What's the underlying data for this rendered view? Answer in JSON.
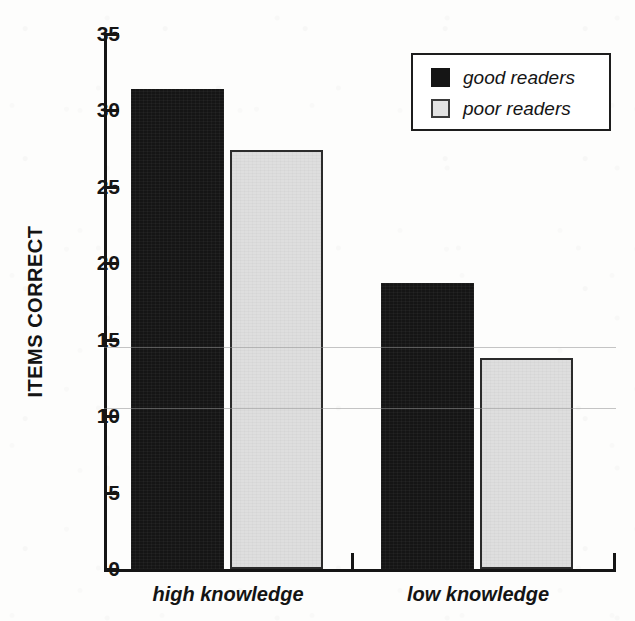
{
  "chart_data": {
    "type": "bar",
    "title": "",
    "subtitle": "",
    "xlabel": "",
    "ylabel": "ITEMS CORRECT",
    "categories": [
      "high knowledge",
      "low knowledge"
    ],
    "series": [
      {
        "name": "good readers",
        "color": "#151515",
        "values": [
          31.4,
          18.7
        ]
      },
      {
        "name": "poor readers",
        "color": "#dedede",
        "values": [
          27.4,
          13.8
        ]
      }
    ],
    "ylim": [
      0,
      35
    ],
    "yticks": [
      0,
      5,
      10,
      15,
      20,
      25,
      30,
      35
    ],
    "ytick_labels": [
      "0",
      "5",
      "10",
      "15",
      "20",
      "25",
      "30",
      "35"
    ],
    "grid": false,
    "legend_position": "top-right",
    "legend_entries": [
      "good readers",
      "poor readers"
    ]
  },
  "axis": {
    "y_title": "ITEMS CORRECT",
    "ticks": [
      {
        "value": 35,
        "label": "35"
      },
      {
        "value": 30,
        "label": "30"
      },
      {
        "value": 25,
        "label": "25"
      },
      {
        "value": 20,
        "label": "20"
      },
      {
        "value": 15,
        "label": "15"
      },
      {
        "value": 10,
        "label": "10"
      },
      {
        "value": 5,
        "label": "5"
      },
      {
        "value": 0,
        "label": "0"
      }
    ],
    "categories": [
      {
        "label": "high knowledge"
      },
      {
        "label": "low knowledge"
      }
    ]
  },
  "legend": {
    "rows": [
      {
        "label": "good readers",
        "swatch": "dark"
      },
      {
        "label": "poor readers",
        "swatch": "light"
      }
    ]
  },
  "bars": [
    {
      "name": "high-knowledge-good-readers",
      "value": 31.4,
      "style": "dark"
    },
    {
      "name": "high-knowledge-poor-readers",
      "value": 27.4,
      "style": "light"
    },
    {
      "name": "low-knowledge-good-readers",
      "value": 18.7,
      "style": "dark"
    },
    {
      "name": "low-knowledge-poor-readers",
      "value": 13.8,
      "style": "light"
    }
  ],
  "colors": {
    "good_readers": "#151515",
    "poor_readers": "#dedede",
    "axis": "#151515",
    "background": "#fdfdfc"
  }
}
